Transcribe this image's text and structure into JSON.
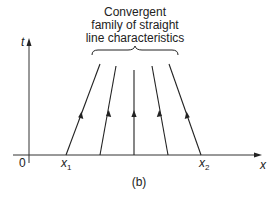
{
  "annotation": {
    "lines": [
      "Convergent",
      "family of straight",
      "line characteristics"
    ]
  },
  "axes": {
    "y_label": "t",
    "x_label": "x",
    "origin_label": "0",
    "x1_label": "x",
    "x1_sub": "1",
    "x2_label": "x",
    "x2_sub": "2"
  },
  "caption": "(b)",
  "colors": {
    "ink": "#222222",
    "background": "#ffffff"
  },
  "characteristics": [
    {
      "x0": 66,
      "x_top": 100
    },
    {
      "x0": 100,
      "x_top": 116
    },
    {
      "x0": 134,
      "x_top": 134
    },
    {
      "x0": 168,
      "x_top": 152
    },
    {
      "x0": 201,
      "x_top": 169
    }
  ]
}
